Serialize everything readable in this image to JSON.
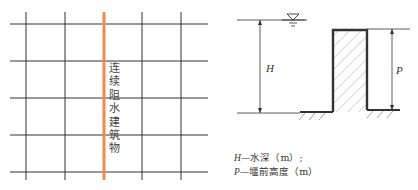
{
  "left_figure": {
    "barrier_label": "连续阻水建筑物",
    "barrier_color": "#f08a4b",
    "grid_color": "#333333"
  },
  "right_figure": {
    "depth_symbol": "H",
    "height_symbol": "P",
    "legend": [
      {
        "symbol": "H",
        "text": "—水深（m）;"
      },
      {
        "symbol": "P",
        "text": "—堰前高度（m）"
      }
    ]
  }
}
